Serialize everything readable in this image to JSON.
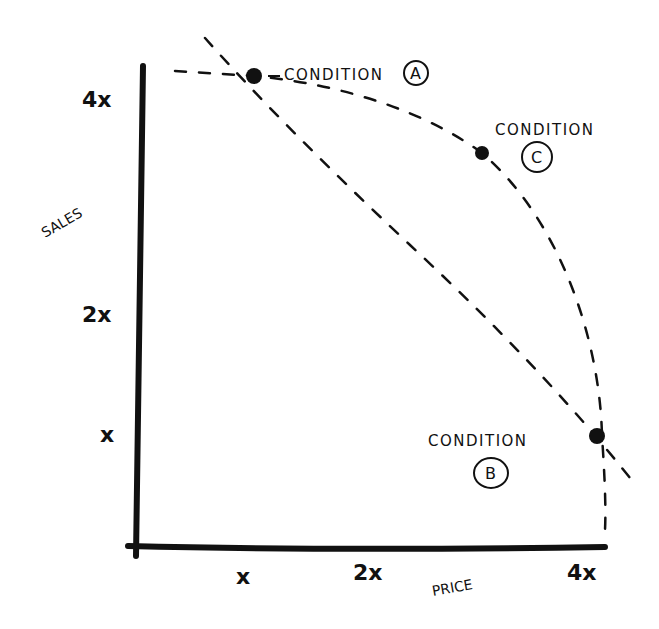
{
  "diagram": {
    "y_axis": {
      "label": "SALES",
      "ticks": [
        {
          "label": "4x",
          "x": 100,
          "y": 107
        },
        {
          "label": "2x",
          "x": 100,
          "y": 322
        },
        {
          "label": "x",
          "x": 112,
          "y": 442
        }
      ]
    },
    "x_axis": {
      "label": "PRICE",
      "ticks": [
        {
          "label": "x",
          "x": 245,
          "y": 585
        },
        {
          "label": "2x",
          "x": 377,
          "y": 580
        },
        {
          "label": "4x",
          "x": 590,
          "y": 580
        }
      ]
    },
    "points": [
      {
        "id": "A",
        "label": "CONDITION",
        "letter": "A",
        "cx": 254,
        "cy": 76
      },
      {
        "id": "C",
        "label": "CONDITION",
        "letter": "C",
        "cx": 482,
        "cy": 153
      },
      {
        "id": "B",
        "label": "CONDITION",
        "letter": "B",
        "cx": 597,
        "cy": 436
      }
    ],
    "colors": {
      "ink": "#111111",
      "background": "#ffffff"
    }
  }
}
